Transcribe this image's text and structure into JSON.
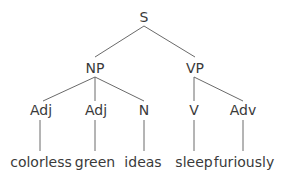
{
  "diagram": {
    "type": "syntax-tree",
    "root": {
      "label": "S",
      "np": {
        "label": "NP",
        "children": [
          {
            "label": "Adj",
            "word": "colorless"
          },
          {
            "label": "Adj",
            "word": "green"
          },
          {
            "label": "N",
            "word": "ideas"
          }
        ]
      },
      "vp": {
        "label": "VP",
        "children": [
          {
            "label": "V",
            "word": "sleep"
          },
          {
            "label": "Adv",
            "word": "furiously"
          }
        ]
      }
    },
    "line_color": "#6a6a6a",
    "text_color": "#3a3a3a"
  }
}
